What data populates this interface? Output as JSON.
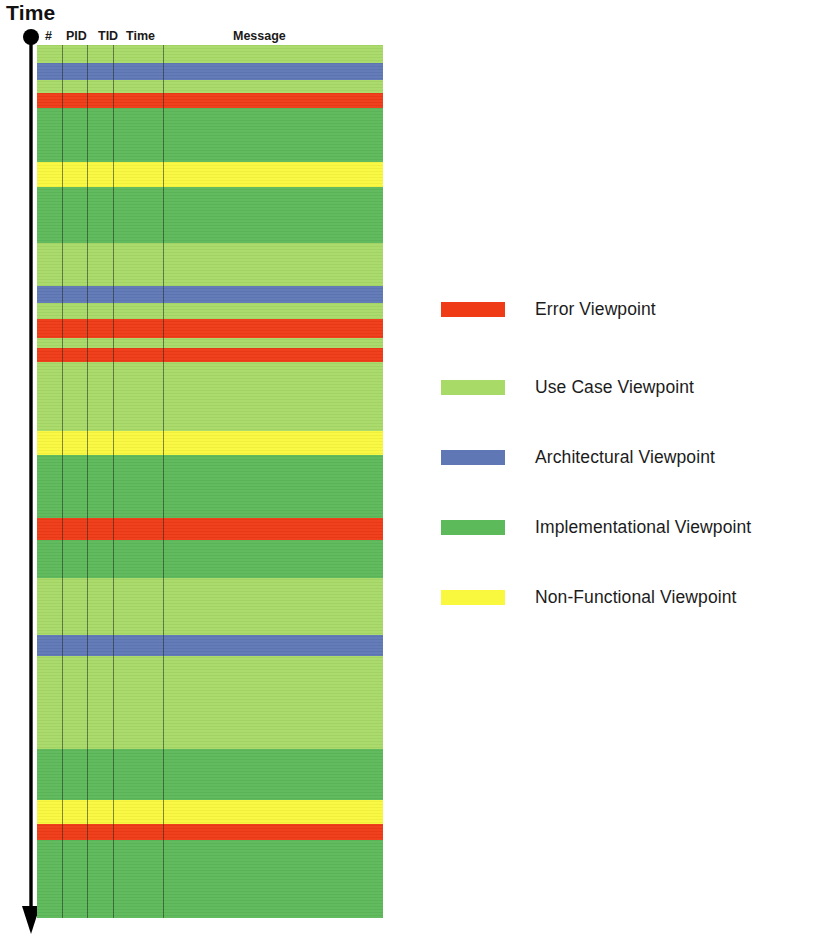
{
  "axis": {
    "label": "Time",
    "direction": "downward",
    "arrow_icon": "arrow-down-icon",
    "dot_icon": "origin-dot-icon"
  },
  "table": {
    "columns": [
      {
        "key": "num",
        "label": "#"
      },
      {
        "key": "pid",
        "label": "PID"
      },
      {
        "key": "tid",
        "label": "TID"
      },
      {
        "key": "time",
        "label": "Time"
      },
      {
        "key": "message",
        "label": "Message"
      }
    ],
    "column_divider_x": [
      25,
      50,
      76,
      126
    ],
    "geometry": {
      "x": 37,
      "y": 45,
      "width": 346,
      "height": 873
    },
    "rows": [
      {
        "viewpoint": "use_case",
        "y": 0,
        "h": 18
      },
      {
        "viewpoint": "architectural",
        "y": 18,
        "h": 17
      },
      {
        "viewpoint": "use_case",
        "y": 35,
        "h": 13
      },
      {
        "viewpoint": "error",
        "y": 48,
        "h": 15
      },
      {
        "viewpoint": "implementational",
        "y": 63,
        "h": 54
      },
      {
        "viewpoint": "non_functional",
        "y": 117,
        "h": 25
      },
      {
        "viewpoint": "implementational",
        "y": 142,
        "h": 56
      },
      {
        "viewpoint": "use_case",
        "y": 198,
        "h": 43
      },
      {
        "viewpoint": "architectural",
        "y": 241,
        "h": 17
      },
      {
        "viewpoint": "use_case",
        "y": 258,
        "h": 16
      },
      {
        "viewpoint": "error",
        "y": 274,
        "h": 19
      },
      {
        "viewpoint": "use_case",
        "y": 293,
        "h": 10
      },
      {
        "viewpoint": "error",
        "y": 303,
        "h": 14
      },
      {
        "viewpoint": "use_case",
        "y": 317,
        "h": 69
      },
      {
        "viewpoint": "non_functional",
        "y": 386,
        "h": 24
      },
      {
        "viewpoint": "implementational",
        "y": 410,
        "h": 63
      },
      {
        "viewpoint": "error",
        "y": 473,
        "h": 22
      },
      {
        "viewpoint": "implementational",
        "y": 495,
        "h": 38
      },
      {
        "viewpoint": "use_case",
        "y": 533,
        "h": 57
      },
      {
        "viewpoint": "architectural",
        "y": 590,
        "h": 21
      },
      {
        "viewpoint": "use_case",
        "y": 611,
        "h": 93
      },
      {
        "viewpoint": "implementational",
        "y": 704,
        "h": 51
      },
      {
        "viewpoint": "non_functional",
        "y": 755,
        "h": 24
      },
      {
        "viewpoint": "error",
        "y": 779,
        "h": 16
      },
      {
        "viewpoint": "implementational",
        "y": 795,
        "h": 78
      }
    ]
  },
  "legend": {
    "items": [
      {
        "label": "Error Viewpoint",
        "viewpoint": "error",
        "color": "#F03B17",
        "top": 0
      },
      {
        "label": "Use Case Viewpoint",
        "viewpoint": "use_case",
        "color": "#A8DA68",
        "top": 78
      },
      {
        "label": "Architectural Viewpoint",
        "viewpoint": "architectural",
        "color": "#5F78B5",
        "top": 148
      },
      {
        "label": "Implementational Viewpoint",
        "viewpoint": "implementational",
        "color": "#5DBA5A",
        "top": 218
      },
      {
        "label": "Non-Functional Viewpoint",
        "viewpoint": "non_functional",
        "color": "#F9F83F",
        "top": 288
      }
    ]
  },
  "colors": {
    "error": "#F03B17",
    "use_case": "#A8DA68",
    "architectural": "#5F78B5",
    "implementational": "#5DBA5A",
    "non_functional": "#F9F83F",
    "axis": "#000000",
    "text": "#1a1a1a"
  }
}
